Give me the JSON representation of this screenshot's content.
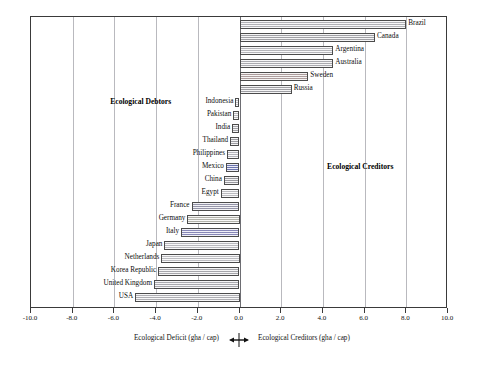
{
  "chart_data": {
    "type": "bar",
    "orientation": "horizontal",
    "title": "",
    "xlabel_left": "Ecological  Deficit (gha / cap)",
    "xlabel_right": "Ecological Creditors (gha / cap)",
    "ylabel": "",
    "xlim": [
      -10.0,
      10.0
    ],
    "grid": true,
    "legend": "none",
    "tick_labels": [
      "-10.0",
      "-8.0",
      "-6.0",
      "-4.0",
      "-2.0",
      "0.0",
      "2.0",
      "4.0",
      "6.0",
      "8.0",
      "10.0"
    ],
    "tick_values": [
      -10,
      -8,
      -6,
      -4,
      -2,
      0,
      2,
      4,
      6,
      8,
      10
    ],
    "annotations": [
      {
        "text": "Ecological Debtors",
        "x": -6.2,
        "y_row": 6
      },
      {
        "text": "Ecological Creditors",
        "x": 4.2,
        "y_row": 11
      }
    ],
    "categories": [
      "Brazil",
      "Canada",
      "Argentina",
      "Australia",
      "Sweden",
      "Russia",
      "Indonesia",
      "Pakistan",
      "India",
      "Thailand",
      "Philippines",
      "Mexico",
      "China",
      "Egypt",
      "France",
      "Germany",
      "Italy",
      "Japan",
      "Netherlands",
      "Korea Republic",
      "United Kingdom",
      "USA"
    ],
    "values": [
      8.0,
      6.5,
      4.5,
      4.5,
      3.3,
      2.5,
      -0.2,
      -0.3,
      -0.35,
      -0.45,
      -0.6,
      -0.65,
      -0.75,
      -0.9,
      -2.3,
      -2.5,
      -2.8,
      -3.6,
      -3.75,
      -3.9,
      -4.1,
      -5.0
    ],
    "bars": [
      {
        "name": "Brazil",
        "value": 8.0,
        "color": "#c9c9cf",
        "side": "right"
      },
      {
        "name": "Canada",
        "value": 6.5,
        "color": "#b7b7bd",
        "side": "right"
      },
      {
        "name": "Argentina",
        "value": 4.5,
        "color": "#cfcfd4",
        "side": "right"
      },
      {
        "name": "Australia",
        "value": 4.5,
        "color": "#c2c2c8",
        "side": "right"
      },
      {
        "name": "Sweden",
        "value": 3.3,
        "color": "#c4b2b2",
        "side": "right"
      },
      {
        "name": "Russia",
        "value": 2.5,
        "color": "#b5b5bb",
        "side": "right"
      },
      {
        "name": "Indonesia",
        "value": -0.2,
        "color": "#d8d8dd",
        "side": "left"
      },
      {
        "name": "Pakistan",
        "value": -0.3,
        "color": "#d0d0d6",
        "side": "left"
      },
      {
        "name": "India",
        "value": -0.35,
        "color": "#b9b9bf",
        "side": "left"
      },
      {
        "name": "Thailand",
        "value": -0.45,
        "color": "#b4b4ba",
        "side": "left"
      },
      {
        "name": "Philippines",
        "value": -0.6,
        "color": "#cdcdd5",
        "side": "left"
      },
      {
        "name": "Mexico",
        "value": -0.65,
        "color": "#7b85c8",
        "side": "left"
      },
      {
        "name": "China",
        "value": -0.75,
        "color": "#b0b0b7",
        "side": "left"
      },
      {
        "name": "Egypt",
        "value": -0.9,
        "color": "#d5d5da",
        "side": "left"
      },
      {
        "name": "France",
        "value": -2.3,
        "color": "#a9a9c0",
        "side": "left"
      },
      {
        "name": "Germany",
        "value": -2.5,
        "color": "#cbcbc2",
        "side": "left"
      },
      {
        "name": "Italy",
        "value": -2.8,
        "color": "#9a9ad0",
        "side": "left"
      },
      {
        "name": "Japan",
        "value": -3.6,
        "color": "#d3d3d8",
        "side": "left"
      },
      {
        "name": "Netherlands",
        "value": -3.75,
        "color": "#d6d6db",
        "side": "left"
      },
      {
        "name": "Korea Republic",
        "value": -3.9,
        "color": "#bdbdc3",
        "side": "left"
      },
      {
        "name": "United Kingdom",
        "value": -4.1,
        "color": "#c0c0c6",
        "side": "left"
      },
      {
        "name": "USA",
        "value": -5.0,
        "color": "#c6c6cc",
        "side": "left"
      }
    ]
  },
  "colors": {
    "frame": "#3a3a3a",
    "grid": "#b9b9be",
    "zero_axis": "#6d6d72",
    "bar_outline": "#4b4b4b",
    "background": "#ffffff"
  }
}
